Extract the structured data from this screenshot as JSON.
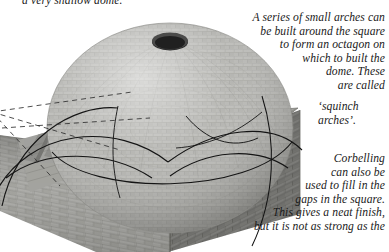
{
  "page": {
    "kind": "architecture-illustration",
    "background_color": "#ffffff",
    "ink_color": "#1a1a1a"
  },
  "annotations": {
    "shallow_dome": "a very shallow dome.",
    "squinch_explain": "A series of small arches can\nbe built around the square\nto form an octagon on\nwhich to built the\ndome. These\nare called",
    "squinch_name": "‘squinch\narches’.",
    "corbelling": "Corbelling\ncan also be\nused to fill in the\ngaps in the square.\nThis gives a neat finish,\nbut it is not as strong as the"
  },
  "illustration": {
    "parts": [
      {
        "name": "dome",
        "label": "stone dome",
        "fill": "#b1b1ad"
      },
      {
        "name": "oculus",
        "label": "oculus opening at dome apex",
        "fill": "#2a2a2a"
      },
      {
        "name": "brick-wall-front",
        "label": "front brick wall of square base",
        "fill": "#9d9d99"
      },
      {
        "name": "brick-wall-right",
        "label": "right brick wall of square base",
        "fill": "#8a8a86"
      },
      {
        "name": "squinch-face",
        "label": "angled squinch corner face",
        "fill": "#a9a9a4"
      },
      {
        "name": "corbel-steps",
        "label": "corbelled stepped courses at left",
        "fill": "#9a9a96"
      },
      {
        "name": "arch-lines",
        "label": "squinch arch guide curves",
        "stroke": "#141414"
      },
      {
        "name": "dashed-lines",
        "label": "dashed construction lines",
        "stroke": "#3a3a3a"
      }
    ]
  }
}
